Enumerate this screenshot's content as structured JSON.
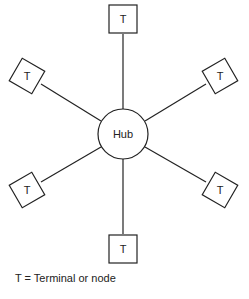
{
  "diagram": {
    "type": "star-topology",
    "hub": {
      "label": "Hub",
      "cx": 123,
      "cy": 134,
      "r": 25
    },
    "nodes": [
      {
        "id": "top",
        "label": "T",
        "cx": 123,
        "cy": 19,
        "rot": 0
      },
      {
        "id": "upper-left",
        "label": "T",
        "cx": 27,
        "cy": 76,
        "rot": 30
      },
      {
        "id": "upper-right",
        "label": "T",
        "cx": 220,
        "cy": 76,
        "rot": -30
      },
      {
        "id": "lower-left",
        "label": "T",
        "cx": 27,
        "cy": 190,
        "rot": -30
      },
      {
        "id": "lower-right",
        "label": "T",
        "cx": 220,
        "cy": 190,
        "rot": 30
      },
      {
        "id": "bottom",
        "label": "T",
        "cx": 123,
        "cy": 249,
        "rot": 0
      }
    ],
    "legend": "T = Terminal or node",
    "caption_partial": "Figure ... Star network"
  },
  "colors": {
    "stroke": "#222222",
    "background": "#ffffff"
  }
}
